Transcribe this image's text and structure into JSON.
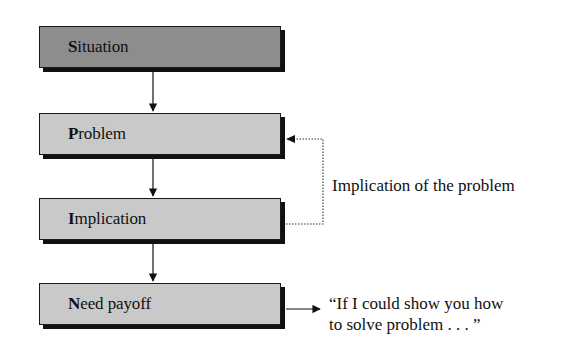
{
  "diagram": {
    "type": "flowchart",
    "nodes": [
      {
        "id": "situation",
        "first_letter": "S",
        "rest": "ituation",
        "label": "Situation",
        "fill": "#8d8d8d"
      },
      {
        "id": "problem",
        "first_letter": "P",
        "rest": "roblem",
        "label": "Problem",
        "fill": "#c9c9c9"
      },
      {
        "id": "implication",
        "first_letter": "I",
        "rest": "mplication",
        "label": "Implication",
        "fill": "#c9c9c9"
      },
      {
        "id": "need_payoff",
        "first_letter": "N",
        "rest": "eed payoff",
        "label": "Need payoff",
        "fill": "#c9c9c9"
      }
    ],
    "edges": [
      {
        "from": "situation",
        "to": "problem",
        "style": "solid"
      },
      {
        "from": "problem",
        "to": "implication",
        "style": "solid"
      },
      {
        "from": "implication",
        "to": "need_payoff",
        "style": "solid"
      },
      {
        "from": "implication",
        "to": "problem",
        "style": "dotted",
        "label": "Implication of the problem"
      },
      {
        "from": "need_payoff",
        "to": "quote",
        "style": "solid"
      }
    ],
    "feedback_label": "Implication of the problem",
    "quote_line1": "“If I could show you how",
    "quote_line2": "to solve problem . . . ”"
  }
}
